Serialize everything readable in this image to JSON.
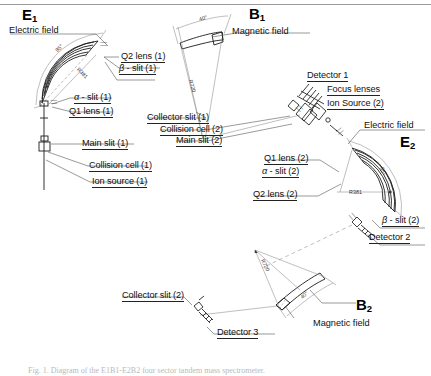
{
  "figure": {
    "caption": "Fig. 1. Diagram of the E1B1-E2B2 four sector tandem mass spectrometer."
  },
  "sectors": [
    {
      "id": "E1",
      "symbol": "E",
      "index": "1",
      "field": "Electric field",
      "radius": "R381",
      "angle": "85°"
    },
    {
      "id": "B1",
      "symbol": "B",
      "index": "1",
      "field": "Magnetic field",
      "radius": "R720",
      "angle": "40°"
    },
    {
      "id": "E2",
      "symbol": "E",
      "index": "2",
      "field": "Electric field",
      "radius": "R381",
      "angle": "85°"
    },
    {
      "id": "B2",
      "symbol": "B",
      "index": "2",
      "field": "Magnetic field",
      "radius": "R720",
      "angle": "40°"
    }
  ],
  "labels": {
    "electric_field_1": "Electric field",
    "magnetic_field_1": "Magnetic field",
    "electric_field_2": "Electric field",
    "magnetic_field_2": "Magnetic field",
    "q2_lens_1": "Q2 lens (1)",
    "beta_slit_1": "β - slit (1)",
    "alpha_slit_1": "α - slit (1)",
    "q1_lens_1": "Q1 lens (1)",
    "main_slit_1": "Main slit (1)",
    "collision_cell_1": "Collision cell (1)",
    "ion_source_1": "Ion source (1)",
    "collector_slit_1": "Collector slit (1)",
    "detector_1": "Detector 1",
    "focus_lenses": "Focus lenses",
    "ion_source_2": "Ion Source (2)",
    "collision_cell_2": "Collision cell (2)",
    "main_slit_2": "Main slit (2)",
    "q1_lens_2": "Q1 lens (2)",
    "alpha_slit_2": "α - slit (2)",
    "q2_lens_2": "Q2 lens (2)",
    "beta_slit_2": "β - slit (2)",
    "detector_2": "Detector 2",
    "collector_slit_2": "Collector slit (2)",
    "detector_3": "Detector 3"
  },
  "dimensions": {
    "e1_angle": "85°",
    "e1_radius": "R381",
    "b1_angle": "40°",
    "b1_radius": "R720",
    "e2_angle": "85°",
    "e2_radius": "R381",
    "b2_angle": "40°",
    "b2_radius": "R720"
  },
  "colors": {
    "line": "#1b1b1b",
    "thin_line": "#6d6d6d",
    "background": "#ffffff",
    "caption": "#b9b9b9"
  }
}
